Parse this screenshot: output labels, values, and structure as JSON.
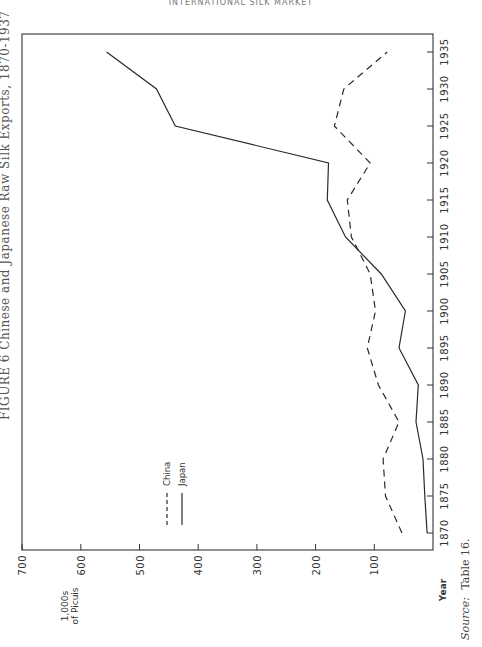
{
  "page": {
    "running_header": "INTERNATIONAL SILK MARKET",
    "figure_title": "FIGURE 6 Chinese and Japanese Raw Silk Exports, 1870-1937",
    "source_label": "Source:",
    "source_text": "Table 16."
  },
  "chart_data": {
    "type": "line",
    "orientation": "rotated 90° counter-clockwise on page (years run bottom-to-top on the right edge; values run right-to-left along the bottom)",
    "title": "Chinese and Japanese Raw Silk Exports, 1870-1937",
    "xlabel": "Year",
    "ylabel": "1,000s of Piculs",
    "ylabel_lines": [
      "1,000s",
      "of Picuis"
    ],
    "x": [
      1870,
      1875,
      1880,
      1885,
      1890,
      1895,
      1900,
      1905,
      1910,
      1915,
      1920,
      1925,
      1930,
      1935
    ],
    "x_tick_labels": [
      "1870",
      "1875",
      "1880",
      "1885",
      "1890",
      "1895",
      "1900",
      "1905",
      "1910",
      "1915",
      "1920",
      "1925",
      "1930",
      "1935"
    ],
    "y_ticks": [
      100,
      200,
      300,
      400,
      500,
      600,
      700
    ],
    "y_tick_labels": [
      "100",
      "200",
      "300",
      "400",
      "500",
      "600",
      "700"
    ],
    "ylim": [
      0,
      700
    ],
    "xlim": [
      1867.5,
      1937.5
    ],
    "grid": false,
    "series": [
      {
        "name": "China",
        "style": "dashed",
        "values": [
          53,
          81,
          85,
          58,
          93,
          112,
          98,
          107,
          139,
          146,
          107,
          168,
          152,
          78
        ]
      },
      {
        "name": "Japan",
        "style": "solid",
        "values": [
          10,
          14,
          17,
          29,
          25,
          58,
          47,
          88,
          149,
          180,
          178,
          439,
          471,
          556
        ]
      }
    ],
    "legend": {
      "position": "inside, lower-middle",
      "entries": [
        {
          "label": "China",
          "style": "dashed"
        },
        {
          "label": "Japan",
          "style": "solid"
        }
      ]
    }
  }
}
